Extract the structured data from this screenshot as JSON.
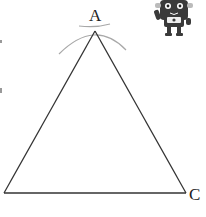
{
  "diagram": {
    "vertices": {
      "A": {
        "label": "A",
        "x": 95,
        "y": 31
      },
      "B": {
        "label": "",
        "x": 4,
        "y": 193
      },
      "C": {
        "label": "C",
        "x": 186,
        "y": 193
      }
    },
    "colors": {
      "stroke": "#333333",
      "arc": "#a8a8a8",
      "mascot": "#3a3a3a"
    },
    "mascot": "robot-mascot",
    "left_edge_marks": [
      "mark-1",
      "mark-2"
    ]
  }
}
